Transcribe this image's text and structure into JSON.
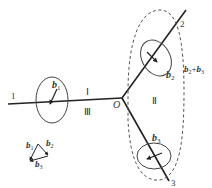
{
  "diagram": {
    "type": "grain-boundary-junction",
    "junction_label": "O",
    "lines": [
      {
        "id": "1",
        "label": "1"
      },
      {
        "id": "2",
        "label": "2"
      },
      {
        "id": "3",
        "label": "3"
      }
    ],
    "regions": [
      {
        "id": "I",
        "label": "Ⅰ"
      },
      {
        "id": "II",
        "label": "Ⅱ"
      },
      {
        "id": "III",
        "label": "Ⅲ"
      }
    ],
    "dislocations": [
      {
        "id": "b1",
        "symbol": "b",
        "sub": "1"
      },
      {
        "id": "b2",
        "symbol": "b",
        "sub": "2"
      },
      {
        "id": "b3",
        "symbol": "b",
        "sub": "3"
      }
    ],
    "sum_label": {
      "a": "b",
      "a_sub": "2",
      "op": "+",
      "b": "b",
      "b_sub": "3"
    },
    "vector_triangle": {
      "labels": [
        {
          "symbol": "b",
          "sub": "1"
        },
        {
          "symbol": "b",
          "sub": "2"
        },
        {
          "symbol": "b",
          "sub": "3"
        }
      ]
    },
    "colors": {
      "line": "#222222",
      "dashed": "#555555",
      "text": "#333333"
    }
  }
}
